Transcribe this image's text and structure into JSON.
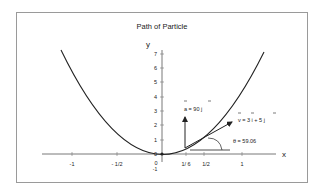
{
  "title": "Path of Particle",
  "axes": {
    "x_label": "x",
    "y_label": "y",
    "x_ticks": [
      {
        "label": "-1",
        "value": -1
      },
      {
        "label": "- 1/2",
        "value": -0.5
      },
      {
        "label": "0",
        "value": 0
      },
      {
        "label": "1/ 6",
        "value": 0.1667
      },
      {
        "label": "1/2",
        "value": 0.5
      },
      {
        "label": "1",
        "value": 1
      }
    ],
    "y_ticks": [
      "0",
      "1",
      "2",
      "3",
      "4",
      "5",
      "6",
      "7"
    ],
    "origin_extra_label": "-1"
  },
  "curve": {
    "equation": "y = 5x^2",
    "x_range": [
      -1.25,
      1.27
    ]
  },
  "annotations": {
    "acceleration": {
      "label": "a = 90 j",
      "direction": "up"
    },
    "velocity": {
      "label": "v = 3 i + 5 j"
    },
    "angle": {
      "label": "θ = 59.06"
    }
  },
  "colors": {
    "frame": "#9a9a9a",
    "ink": "#222222",
    "background": "#ffffff"
  }
}
